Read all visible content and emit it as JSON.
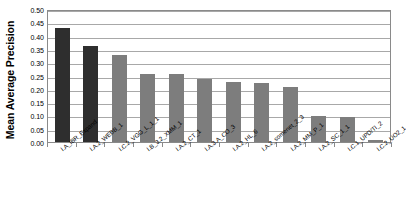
{
  "chart_data": {
    "type": "bar",
    "title": "",
    "xlabel": "",
    "ylabel": "Mean Average Precision",
    "ylim": [
      0.0,
      0.5
    ],
    "grid": true,
    "legend": "none",
    "y_ticks": [
      "0.00",
      "0.05",
      "0.10",
      "0.15",
      "0.20",
      "0.25",
      "0.30",
      "0.35",
      "0.40",
      "0.45",
      "0.50"
    ],
    "y_tick_values": [
      0.0,
      0.05,
      0.1,
      0.15,
      0.2,
      0.25,
      0.3,
      0.35,
      0.4,
      0.45,
      0.5
    ],
    "categories": [
      "I.A_IBR_Expand",
      "I.A.2_WEBB_1",
      "I.C.2_VGG_L_1_1",
      "I.B_3.2_XMM_1",
      "I.A.2_CT_1",
      "I.A.3.A_CO_3",
      "I.A.2_HL_6",
      "I.A.2_somenet_2_3",
      "I.A.2_MM_P_1",
      "I.A.2_SC_1_1",
      "I.C.1_UPD/TI_2",
      "I.C.2_UO2_1"
    ],
    "values": [
      0.43,
      0.36,
      0.328,
      0.257,
      0.254,
      0.237,
      0.227,
      0.222,
      0.206,
      0.096,
      0.095,
      0.007
    ],
    "bar_colors": [
      "#2e2e2e",
      "#2e2e2e",
      "#7d7d7d",
      "#7d7d7d",
      "#7d7d7d",
      "#7d7d7d",
      "#7d7d7d",
      "#7d7d7d",
      "#7d7d7d",
      "#7d7d7d",
      "#7d7d7d",
      "#7d7d7d"
    ],
    "colors": {
      "highlight_bar": "#2e2e2e",
      "default_bar": "#7d7d7d",
      "gridline": "#a8a8a8",
      "frame": "#8a8a8a",
      "text": "#000000",
      "background": "#ffffff"
    }
  }
}
